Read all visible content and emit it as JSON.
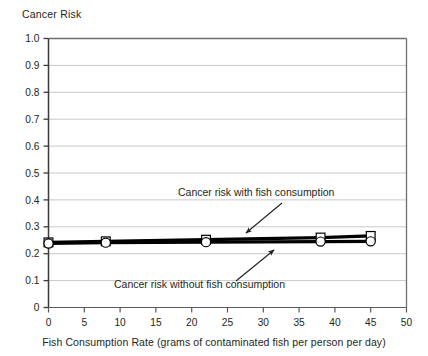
{
  "chart_data": {
    "type": "line",
    "title": "Cancer Risk",
    "xlabel": "Fish Consumption Rate (grams of contaminated fish per person per day)",
    "ylabel": "Cancer Risk",
    "xlim": [
      0,
      50
    ],
    "ylim": [
      0,
      1.0
    ],
    "grid": true,
    "legend": "none",
    "xticks": [
      "0",
      "5",
      "10",
      "15",
      "20",
      "25",
      "30",
      "35",
      "40",
      "45",
      "50"
    ],
    "xtick_values": [
      0,
      5,
      10,
      15,
      20,
      25,
      30,
      35,
      40,
      45,
      50
    ],
    "yticks": [
      "0",
      "0.1",
      "0.2",
      "0.3",
      "0.4",
      "0.5",
      "0.6",
      "0.7",
      "0.8",
      "0.9",
      "1.0"
    ],
    "ytick_values": [
      0,
      0.1,
      0.2,
      0.3,
      0.4,
      0.5,
      0.6,
      0.7,
      0.8,
      0.9,
      1.0
    ],
    "series": [
      {
        "name": "Cancer risk with fish consumption",
        "marker": "square",
        "x": [
          0,
          8,
          22,
          38,
          45
        ],
        "values": [
          0.242,
          0.246,
          0.252,
          0.26,
          0.266
        ]
      },
      {
        "name": "Cancer risk without fish consumption",
        "marker": "circle",
        "x": [
          0,
          8,
          22,
          38,
          45
        ],
        "values": [
          0.238,
          0.241,
          0.243,
          0.245,
          0.246
        ]
      }
    ],
    "annotations": [
      {
        "text": "Cancer risk with fish consumption",
        "text_x": 178,
        "text_y": 196,
        "arrow_from_x": 282,
        "arrow_from_y": 203,
        "arrow_to_x": 246,
        "arrow_to_y": 233
      },
      {
        "text": "Cancer risk without fish consumption",
        "text_x": 114,
        "text_y": 288,
        "arrow_from_x": 236,
        "arrow_from_y": 281,
        "arrow_to_x": 274,
        "arrow_to_y": 250
      }
    ],
    "colors": {
      "line": "#000000",
      "marker_fill": "#ffffff",
      "grid": "#c9c9c9",
      "axis": "#58595b",
      "border": "#6d6e71",
      "text": "#231f20"
    }
  }
}
